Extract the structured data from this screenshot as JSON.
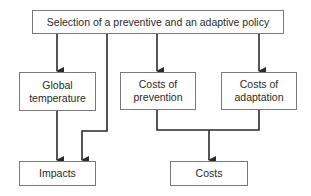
{
  "diagram": {
    "type": "flowchart",
    "nodes": {
      "policy": {
        "label": "Selection of a preventive and an adaptive policy"
      },
      "temperature": {
        "line1": "Global",
        "line2": "temperature"
      },
      "prevention": {
        "line1": "Costs of",
        "line2": "prevention"
      },
      "adaptation": {
        "line1": "Costs of",
        "line2": "adaptation"
      },
      "impacts": {
        "label": "Impacts"
      },
      "costs": {
        "label": "Costs"
      }
    },
    "edges": [
      {
        "from": "policy",
        "to": "temperature"
      },
      {
        "from": "policy",
        "to": "impacts"
      },
      {
        "from": "policy",
        "to": "prevention"
      },
      {
        "from": "policy",
        "to": "adaptation"
      },
      {
        "from": "temperature",
        "to": "impacts"
      },
      {
        "from": "prevention",
        "to": "costs"
      },
      {
        "from": "adaptation",
        "to": "costs"
      }
    ],
    "colors": {
      "line": "#2a2a2a",
      "border": "#7a7a7a"
    }
  }
}
